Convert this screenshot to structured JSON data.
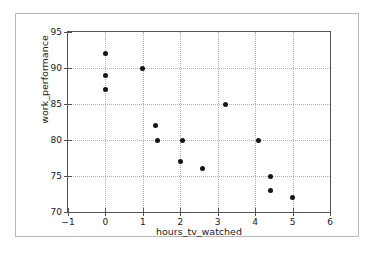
{
  "chart_data": {
    "type": "scatter",
    "title": "",
    "xlabel": "hours_tv_watched",
    "ylabel": "work_performance",
    "xlim": [
      -1,
      6
    ],
    "ylim": [
      70,
      95
    ],
    "xticks": [
      -1,
      0,
      1,
      2,
      3,
      4,
      5,
      6
    ],
    "xtick_labels": [
      "−1",
      "0",
      "1",
      "2",
      "3",
      "4",
      "5",
      "6"
    ],
    "yticks": [
      70,
      75,
      80,
      85,
      90,
      95
    ],
    "ytick_labels": [
      "70",
      "75",
      "80",
      "85",
      "90",
      "95"
    ],
    "grid": true,
    "grid_style": "dotted",
    "legend": false,
    "marker": "circle",
    "marker_color": "#151515",
    "points": [
      {
        "x": 0.0,
        "y": 92
      },
      {
        "x": 0.0,
        "y": 89
      },
      {
        "x": 0.0,
        "y": 87
      },
      {
        "x": 1.0,
        "y": 90
      },
      {
        "x": 1.35,
        "y": 82
      },
      {
        "x": 1.4,
        "y": 80
      },
      {
        "x": 2.0,
        "y": 77
      },
      {
        "x": 2.05,
        "y": 80
      },
      {
        "x": 2.6,
        "y": 76
      },
      {
        "x": 3.2,
        "y": 85
      },
      {
        "x": 4.1,
        "y": 80
      },
      {
        "x": 4.4,
        "y": 75
      },
      {
        "x": 4.4,
        "y": 73
      },
      {
        "x": 5.0,
        "y": 72
      }
    ]
  },
  "figure": {
    "background_color": "#ffffff",
    "border_color": "#b9b9bd",
    "axes_color": "#545454",
    "grid_color": "#b0b0b0"
  }
}
